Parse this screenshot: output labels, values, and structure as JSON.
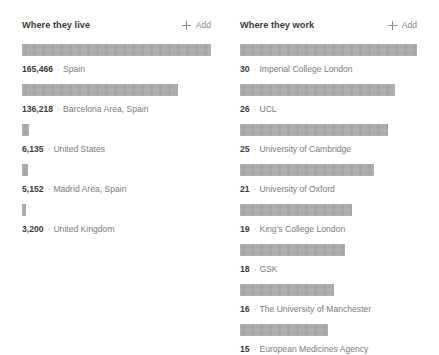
{
  "panels": [
    {
      "id": "where-they-live",
      "title": "Where they live",
      "add": {
        "label": "Add",
        "icon": "plus-icon"
      },
      "items": [
        {
          "count": "165,466",
          "sep": "·",
          "name": "Spain",
          "bar_pct": 100.0
        },
        {
          "count": "136,218",
          "sep": "·",
          "name": "Barcelona Area, Spain",
          "bar_pct": 82.4
        },
        {
          "count": "6,135",
          "sep": "·",
          "name": "United States",
          "bar_pct": 3.7
        },
        {
          "count": "5,152",
          "sep": "·",
          "name": "Madrid Area, Spain",
          "bar_pct": 3.1
        },
        {
          "count": "3,200",
          "sep": "·",
          "name": "United Kingdom",
          "bar_pct": 2.1
        }
      ]
    },
    {
      "id": "where-they-work",
      "title": "Where they work",
      "add": {
        "label": "Add",
        "icon": "plus-icon"
      },
      "items": [
        {
          "count": "30",
          "sep": "·",
          "name": "Imperial College London",
          "bar_pct": 100.0
        },
        {
          "count": "26",
          "sep": "·",
          "name": "UCL",
          "bar_pct": 87.6
        },
        {
          "count": "25",
          "sep": "·",
          "name": "University of Cambridge",
          "bar_pct": 83.6
        },
        {
          "count": "21",
          "sep": "·",
          "name": "University of Oxford",
          "bar_pct": 75.7
        },
        {
          "count": "19",
          "sep": "·",
          "name": "King's College London",
          "bar_pct": 63.3
        },
        {
          "count": "18",
          "sep": "·",
          "name": "GSK",
          "bar_pct": 59.3
        },
        {
          "count": "16",
          "sep": "·",
          "name": "The University of Manchester",
          "bar_pct": 53.1
        },
        {
          "count": "15",
          "sep": "·",
          "name": "European Medicines Agency",
          "bar_pct": 49.7
        }
      ]
    }
  ],
  "chart_data": {
    "type": "bar",
    "charts": [
      {
        "title": "Where they live",
        "type": "bar",
        "orientation": "horizontal",
        "categories": [
          "Spain",
          "Barcelona Area, Spain",
          "United States",
          "Madrid Area, Spain",
          "United Kingdom"
        ],
        "values": [
          165466,
          136218,
          6135,
          5152,
          3200
        ],
        "xlabel": "",
        "ylabel": "",
        "grid": false,
        "legend": "none"
      },
      {
        "title": "Where they work",
        "type": "bar",
        "orientation": "horizontal",
        "categories": [
          "Imperial College London",
          "UCL",
          "University of Cambridge",
          "University of Oxford",
          "King's College London",
          "GSK",
          "The University of Manchester",
          "European Medicines Agency"
        ],
        "values": [
          30,
          26,
          25,
          21,
          19,
          18,
          16,
          15
        ],
        "xlabel": "",
        "ylabel": "",
        "grid": false,
        "legend": "none"
      }
    ]
  },
  "colors": {
    "bar": "#ababab",
    "title_text": "#3b3b3b",
    "muted_text": "#7d7d7d",
    "add_text": "#8a8a8a",
    "background": "#ffffff"
  }
}
